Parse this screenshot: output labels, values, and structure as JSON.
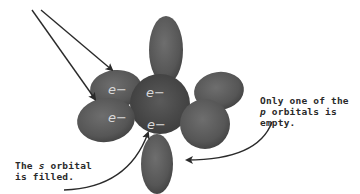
{
  "diagram": {
    "type": "atomic-orbital-illustration",
    "electrons": [
      {
        "id": "e1",
        "label": "e−",
        "orbital": "p-upper-left"
      },
      {
        "id": "e2",
        "label": "e−",
        "orbital": "s-center-top"
      },
      {
        "id": "e3",
        "label": "e−",
        "orbital": "p-lower-left"
      },
      {
        "id": "e4",
        "label": "e−",
        "orbital": "s-center-bottom"
      }
    ],
    "annotations": {
      "s_orbital": {
        "line1_pre": "The ",
        "line1_var": "s",
        "line1_post": " orbital",
        "line2": "is filled."
      },
      "p_orbital": {
        "line1": "Only one of the",
        "line2_var": "p",
        "line2_post": " orbitals is empty."
      }
    },
    "colors": {
      "lobe_fill": "#5c5c5c",
      "lobe_dark": "#3e3e3e",
      "lobe_light": "#707070",
      "arrow": "#2a2a2a",
      "background": "#ffffff"
    }
  }
}
